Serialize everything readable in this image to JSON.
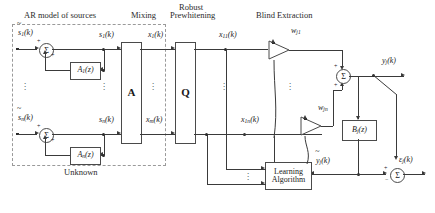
{
  "headers": {
    "ar_model": "AR model of sources",
    "mixing": "Mixing",
    "prewhitening_line1": "Robust",
    "prewhitening_line2": "Prewhitening",
    "blind_extraction": "Blind Extraction",
    "unknown": "Unknown"
  },
  "blocks": {
    "ar1": "A",
    "ar1_sub": "1",
    "ar1_arg": "(z)",
    "arn": "A",
    "arn_sub": "n",
    "arn_arg": "(z)",
    "mixing_matrix": "A",
    "prewhitening_matrix": "Q",
    "filter_b": "B",
    "filter_b_sub": "j",
    "filter_b_arg": "(z)",
    "learning_line1": "Learning",
    "learning_line2": "Algorithm"
  },
  "signals": {
    "s_tilde_1": "s",
    "s_tilde_1_sub": "1",
    "s_tilde_1_arg": "(k)",
    "s_tilde_n": "s",
    "s_tilde_n_sub": "n",
    "s_tilde_n_arg": "(k)",
    "s1": "s",
    "s1_sub": "1",
    "s1_arg": "(k)",
    "sn": "s",
    "sn_sub": "n",
    "sn_arg": "(k)",
    "x1": "x",
    "x1_sub": "1",
    "x1_arg": "(k)",
    "xm": "x",
    "xm_sub": "m",
    "xm_arg": "(k)",
    "x11": "x",
    "x11_sub": "11",
    "x11_arg": "(k)",
    "x1n": "x",
    "x1n_sub": "1n",
    "x1n_arg": "(k)",
    "w_j1": "w",
    "w_j1_sub": "j1",
    "w_jn": "w",
    "w_jn_sub": "jn",
    "y_j": "y",
    "y_j_sub": "j",
    "y_j_arg": "(k)",
    "y_tilde_j": "y",
    "y_tilde_j_sub": "j",
    "y_tilde_j_arg": "(k)",
    "eps_j": "ε",
    "eps_j_sub": "j",
    "eps_j_arg": "(k)",
    "sum_symbol": "Σ",
    "plus": "+",
    "minus": "−",
    "vdots": "⋮"
  },
  "colors": {
    "background": "#ffffff",
    "line": "#3a3a3a",
    "box_border": "#4a4a4a",
    "dashed_border": "#9a9a9a",
    "text": "#1a1a1a"
  }
}
